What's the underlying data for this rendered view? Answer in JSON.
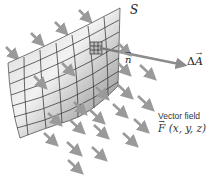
{
  "figure": {
    "surface_label": "S",
    "normal_label": "n",
    "area_element_label": "ΔA",
    "area_element_prefix": "Δ",
    "area_element_symbol": "A",
    "vector_field_caption": "Vector field",
    "vector_field_symbol": "F",
    "vector_field_args": " (x, y, z)"
  },
  "colors": {
    "background": "#ffffff",
    "surface_light": "#e6e6e6",
    "surface_dark": "#8a8a8a",
    "grid_lines": "#2a2a2a",
    "field_arrows": "#9a9a9a",
    "normal_arrow": "#8c8c8c",
    "text": "#222222"
  }
}
